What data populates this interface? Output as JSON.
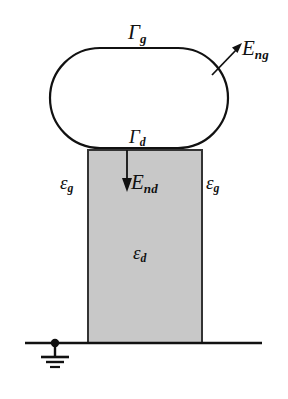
{
  "figure": {
    "background_color": "#ffffff",
    "width": 288,
    "height": 399,
    "caption": "",
    "stroke_color": "#111111",
    "dielectric_fill_color": "#c8c8c8"
  },
  "labels": {
    "gamma_g": {
      "symbol": "Γ",
      "subscript": "g"
    },
    "gamma_d": {
      "symbol": "Γ",
      "subscript": "d"
    },
    "e_ng": {
      "symbol": "E",
      "subscript": "ng"
    },
    "e_nd": {
      "symbol": "E",
      "subscript": "nd"
    },
    "eps_g_left": {
      "symbol": "ε",
      "subscript": "g"
    },
    "eps_g_right": {
      "symbol": "ε",
      "subscript": "g"
    },
    "eps_d": {
      "symbol": "ε",
      "subscript": "d"
    }
  },
  "shapes": {
    "gate_region": {
      "name": "stadium-outline",
      "fill": "none",
      "stroke": "#111111",
      "stroke_width": 2
    },
    "dielectric_column": {
      "name": "shaded-rectangle",
      "fill": "#c8c8c8",
      "stroke": "#333333",
      "stroke_width": 2
    },
    "ground_line": {
      "name": "baseline",
      "stroke": "#111111",
      "stroke_width": 2
    },
    "ground_symbol": {
      "name": "earth-ground",
      "bars": 3
    }
  },
  "arrows": {
    "e_ng_arrow": {
      "direction": "up-right",
      "name": "normal-field-gate"
    },
    "e_nd_arrow": {
      "direction": "down",
      "name": "normal-field-dielectric"
    }
  }
}
